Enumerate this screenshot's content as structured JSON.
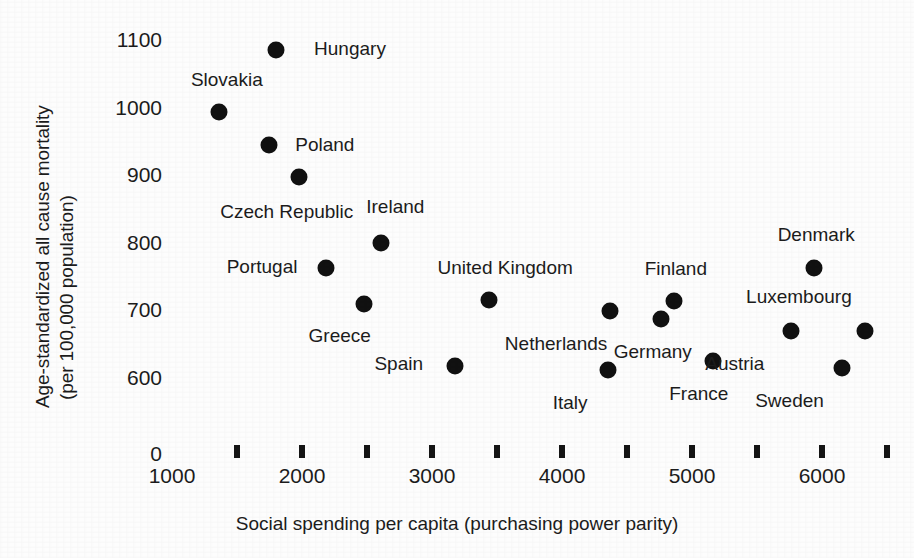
{
  "chart_data": {
    "type": "scatter",
    "title": "",
    "xlabel": "Social spending per capita (purchasing power parity)",
    "ylabel_line1": "Age-standardized all cause mortality",
    "ylabel_line2": "(per 100,000 population)",
    "xlim": [
      1000,
      6500
    ],
    "ylim": [
      580,
      1130
    ],
    "grid": false,
    "legend": "none",
    "y_broken_axis": true,
    "y_zero_label": "0",
    "xticks": [
      1000,
      2000,
      3000,
      4000,
      5000,
      6000
    ],
    "xtick_labels": [
      "1000",
      "2000",
      "3000",
      "4000",
      "5000",
      "6000"
    ],
    "xtick_marks": [
      1500,
      2000,
      2500,
      3000,
      3500,
      4000,
      4500,
      5000,
      5500,
      6000,
      6500
    ],
    "yticks": [
      600,
      700,
      800,
      900,
      1000,
      1100
    ],
    "ytick_labels": [
      "600",
      "700",
      "800",
      "900",
      "1000",
      "1100"
    ],
    "points": [
      {
        "label": "Hungary",
        "x": 1800,
        "y": 1085,
        "label_dx": 74,
        "label_dy": -1
      },
      {
        "label": "Slovakia",
        "x": 1360,
        "y": 993,
        "label_dx": 8,
        "label_dy": -32
      },
      {
        "label": "Poland",
        "x": 1745,
        "y": 945,
        "label_dx": 56,
        "label_dy": 0
      },
      {
        "label": "Czech Republic",
        "x": 1975,
        "y": 897,
        "label_dx": -12,
        "label_dy": 35
      },
      {
        "label": "Ireland",
        "x": 2610,
        "y": 799,
        "label_dx": 14,
        "label_dy": -36
      },
      {
        "label": "Portugal",
        "x": 2185,
        "y": 762,
        "label_dx": -64,
        "label_dy": -1
      },
      {
        "label": "Greece",
        "x": 2475,
        "y": 709,
        "label_dx": -24,
        "label_dy": 32
      },
      {
        "label": "United Kingdom",
        "x": 3440,
        "y": 715,
        "label_dx": 16,
        "label_dy": -32
      },
      {
        "label": "Netherlands",
        "x": 4370,
        "y": 699,
        "label_dx": -54,
        "label_dy": 33
      },
      {
        "label": "Finland",
        "x": 4860,
        "y": 714,
        "label_dx": 2,
        "label_dy": -32
      },
      {
        "label": "Germany",
        "x": 4760,
        "y": 687,
        "label_dx": -8,
        "label_dy": 33
      },
      {
        "label": "Spain",
        "x": 3175,
        "y": 618,
        "label_dx": -56,
        "label_dy": -2
      },
      {
        "label": "Italy",
        "x": 4355,
        "y": 612,
        "label_dx": -38,
        "label_dy": 33
      },
      {
        "label": "France",
        "x": 5160,
        "y": 625,
        "label_dx": -14,
        "label_dy": 33
      },
      {
        "label": "Denmark",
        "x": 5940,
        "y": 762,
        "label_dx": 2,
        "label_dy": -33
      },
      {
        "label": "Luxembourg",
        "x": 6330,
        "y": 670,
        "label_dx": -66,
        "label_dy": -34
      },
      {
        "label": "Austria",
        "x": 5760,
        "y": 670,
        "label_dx": -56,
        "label_dy": 33
      },
      {
        "label": "Sweden",
        "x": 6150,
        "y": 615,
        "label_dx": -52,
        "label_dy": 33
      }
    ]
  },
  "colors": {
    "marker": "#111111",
    "text": "#1c1c1c",
    "background": "#fdfdfd"
  }
}
